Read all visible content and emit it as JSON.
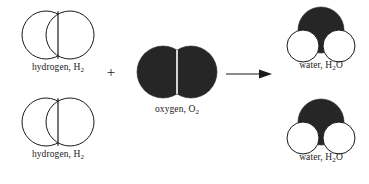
{
  "diagram": {
    "type": "chemical-reaction-space-filling",
    "equation": "2 H2 + O2 -> 2 H2O",
    "background_color": "#ffffff",
    "atom_colors": {
      "hydrogen": "#ffffff",
      "hydrogen_outline": "#1a1a1a",
      "oxygen": "#262626"
    },
    "reactants": [
      {
        "id": "hydrogen-molecule-1",
        "name": "hydrogen",
        "formula_base": "H",
        "formula_sub": "2",
        "label_text": "hydrogen, H",
        "label_sub": "2",
        "atom_count": 2,
        "atom_type": "hydrogen"
      },
      {
        "id": "hydrogen-molecule-2",
        "name": "hydrogen",
        "formula_base": "H",
        "formula_sub": "2",
        "label_text": "hydrogen, H",
        "label_sub": "2",
        "atom_count": 2,
        "atom_type": "hydrogen"
      },
      {
        "id": "oxygen-molecule",
        "name": "oxygen",
        "formula_base": "O",
        "formula_sub": "2",
        "label_text": "oxygen, O",
        "label_sub": "2",
        "atom_count": 2,
        "atom_type": "oxygen"
      }
    ],
    "products": [
      {
        "id": "water-molecule-1",
        "name": "water",
        "label_prefix": "water, H",
        "label_sub": "2",
        "label_suffix": "O",
        "atom_count": 3
      },
      {
        "id": "water-molecule-2",
        "name": "water",
        "label_prefix": "water, H",
        "label_sub": "2",
        "label_suffix": "O",
        "atom_count": 3
      }
    ],
    "operators": {
      "plus": "+",
      "arrow": "right-arrow"
    }
  }
}
